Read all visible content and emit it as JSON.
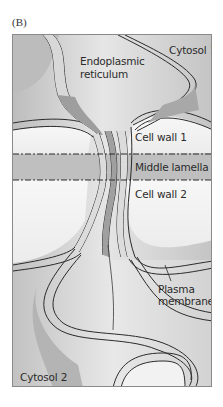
{
  "panel": {
    "label": "(B)"
  },
  "labels": {
    "cytosol_1": "Cytosol 1",
    "endoplasmic_reticulum_line1": "Endoplasmic",
    "endoplasmic_reticulum_line2": "reticulum",
    "cell_wall_1": "Cell wall 1",
    "middle_lamella": "Middle lamella",
    "cell_wall_2": "Cell wall 2",
    "plasma_membrane_line1": "Plasma",
    "plasma_membrane_line2": "membrane",
    "cytosol_2": "Cytosol 2"
  },
  "colors": {
    "frame_border": "#8a8a8a",
    "cytosol_fill": "#c9c9c9",
    "cytosol_light": "#e2e2e2",
    "cell_wall_fill": "#f4f4f4",
    "middle_lamella_fill": "#b9b9b9",
    "membrane_fill": "#dcdcdc",
    "er_fill": "#a9a9a9",
    "outline": "#2a2a2a"
  }
}
